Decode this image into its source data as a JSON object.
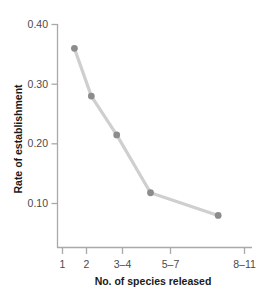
{
  "chart_data": {
    "type": "line",
    "title": "",
    "subtitle": "",
    "xlabel": "No. of species released",
    "ylabel": "Rate of establishment",
    "categories": [
      "1",
      "2",
      "3–4",
      "5–7",
      "8–11"
    ],
    "values": [
      0.36,
      0.28,
      0.215,
      0.118,
      0.08
    ],
    "series": [
      {
        "name": "Rate of establishment",
        "values": [
          0.36,
          0.28,
          0.215,
          0.118,
          0.08
        ]
      }
    ],
    "x_tick_labels": [
      "1",
      "2",
      "3–4",
      "5–7",
      "8–11"
    ],
    "x_tick_positions": [
      1,
      2,
      3.5,
      5.5,
      9.5
    ],
    "xlim": [
      0,
      11.5
    ],
    "ylim": [
      0,
      0.4
    ],
    "y_tick_labels": [
      "0.10",
      "0.20",
      "0.30",
      "0.40"
    ],
    "y_tick_values": [
      0.1,
      0.2,
      0.3,
      0.4
    ],
    "grid": false,
    "legend": false,
    "legend_position": "none",
    "marker": "circle",
    "colors": {
      "line": "#cfcfcf",
      "marker": "#8c8c8c",
      "axis": "#a9a9a9",
      "tick_label": "#4a4a4a",
      "axis_title": "#1a1a1a",
      "background": "#ffffff"
    }
  }
}
